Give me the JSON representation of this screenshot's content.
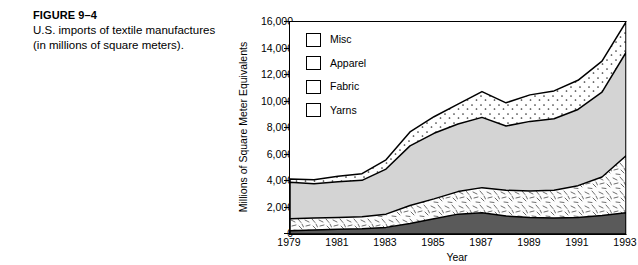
{
  "figure": {
    "number": "FIGURE 9–4",
    "caption": "U.S. imports of textile manufactures (in millions of square meters)."
  },
  "legend": {
    "position": "inside-top-left",
    "items": [
      {
        "label": "Misc",
        "fill": "dotted",
        "color": "#ffffff"
      },
      {
        "label": "Apparel",
        "fill": "solid",
        "color": "#d4d4d4"
      },
      {
        "label": "Fabric",
        "fill": "hatched",
        "color": "#fdfdfd"
      },
      {
        "label": "Yarns",
        "fill": "solid",
        "color": "#5a5a5a"
      }
    ]
  },
  "chart_data": {
    "type": "area",
    "stacked": true,
    "title": "",
    "xlabel": "Year",
    "ylabel": "Millions of Square Meter Equivalents",
    "xlim": [
      1979,
      1993
    ],
    "ylim": [
      0,
      16000
    ],
    "ytick_labels": [
      "16,000",
      "14,000",
      "12,000",
      "10,000",
      "8,000",
      "6,000",
      "4,000",
      "2,000",
      "0"
    ],
    "ytick_values": [
      16000,
      14000,
      12000,
      10000,
      8000,
      6000,
      4000,
      2000,
      0
    ],
    "xtick_labels": [
      "1979",
      "1981",
      "1983",
      "1985",
      "1987",
      "1989",
      "1991",
      "1993"
    ],
    "xtick_values": [
      1979,
      1981,
      1983,
      1985,
      1987,
      1989,
      1991,
      1993
    ],
    "grid": false,
    "x": [
      1979,
      1980,
      1981,
      1982,
      1983,
      1984,
      1985,
      1986,
      1987,
      1988,
      1989,
      1990,
      1991,
      1992,
      1993
    ],
    "series": [
      {
        "name": "Yarns",
        "order": 1,
        "values": [
          250,
          300,
          350,
          400,
          500,
          800,
          1150,
          1500,
          1600,
          1350,
          1250,
          1200,
          1250,
          1400,
          1600
        ]
      },
      {
        "name": "Fabric",
        "order": 2,
        "values": [
          900,
          900,
          900,
          900,
          1000,
          1350,
          1500,
          1700,
          1900,
          1950,
          2000,
          2100,
          2400,
          2900,
          4300
        ]
      },
      {
        "name": "Apparel",
        "order": 3,
        "values": [
          2750,
          2600,
          2700,
          2750,
          3400,
          4500,
          4950,
          5100,
          5300,
          4850,
          5250,
          5400,
          5750,
          6400,
          7800
        ]
      },
      {
        "name": "Misc",
        "order": 4,
        "values": [
          250,
          300,
          400,
          500,
          700,
          1050,
          1250,
          1500,
          1950,
          1750,
          2000,
          2100,
          2200,
          2350,
          2300
        ]
      }
    ],
    "totals": [
      4150,
      4100,
      4350,
      4550,
      5600,
      7700,
      8850,
      9800,
      10750,
      9900,
      10500,
      10800,
      11600,
      13050,
      16000
    ]
  }
}
